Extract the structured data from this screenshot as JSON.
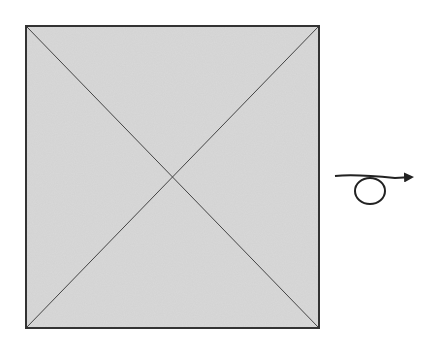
{
  "diagram": {
    "square": {
      "x": 26,
      "y": 26,
      "width": 293,
      "height": 302,
      "fill": "#d2d2d2",
      "stroke": "#333333"
    },
    "diagonals": {
      "stroke": "#444444"
    },
    "rotation_arrow": {
      "stroke": "#222222",
      "direction": "right"
    }
  }
}
